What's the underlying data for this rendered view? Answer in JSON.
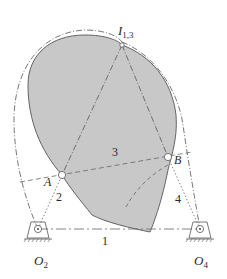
{
  "diagram": {
    "type": "four-bar linkage with coupler (link 3) and instant center",
    "colors": {
      "coupler_fill": "#c8c8c8",
      "stroke": "#4a4a4a",
      "label": "#2a2a2a",
      "background": "#ffffff"
    },
    "points": {
      "O2": {
        "label": "O",
        "sub": "2"
      },
      "O4": {
        "label": "O",
        "sub": "4"
      },
      "A": {
        "label": "A"
      },
      "B": {
        "label": "B"
      },
      "I13": {
        "label": "I",
        "sub": "1,3"
      }
    },
    "links": {
      "ground": "1",
      "crank": "2",
      "coupler": "3",
      "rocker": "4"
    }
  }
}
